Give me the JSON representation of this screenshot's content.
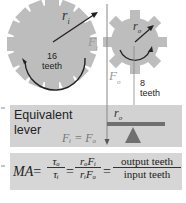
{
  "diagram": {
    "input_gear": {
      "radius_label": "r",
      "radius_sub": "i",
      "teeth_count": "16",
      "teeth_label": "teeth",
      "force_label": "F",
      "force_sub": "i"
    },
    "output_gear": {
      "radius_label": "r",
      "radius_sub": "o",
      "teeth_count": "8",
      "teeth_label": "teeth",
      "force_label": "F",
      "force_sub": "o"
    },
    "lever": {
      "title_line1": "Equivalent",
      "title_line2": "lever",
      "radius_label": "r",
      "radius_sub": "o",
      "equation": "Fᵢ = Fₒ"
    },
    "formula": {
      "lhs": "MA",
      "eq": "=",
      "frac1_num": "τₒ",
      "frac1_den": "τᵢ",
      "frac2_num": "rₒFᵢ",
      "frac2_den": "rᵢFₒ",
      "frac3_num": "output teeth",
      "frac3_den": "input teeth"
    },
    "colors": {
      "gear_fill": "#bdbdbd",
      "lever_panel": "#d2d2d2",
      "formula_panel": "#d6d6d6",
      "arrow": "#222222"
    }
  }
}
